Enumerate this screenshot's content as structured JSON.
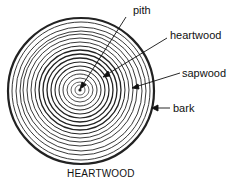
{
  "diagram": {
    "title": "HEARTWOOD",
    "labels": {
      "pith": "pith",
      "heartwood": "heartwood",
      "sapwood": "sapwood",
      "bark": "bark"
    },
    "colors": {
      "ink": "#111111",
      "background": "#ffffff"
    }
  }
}
